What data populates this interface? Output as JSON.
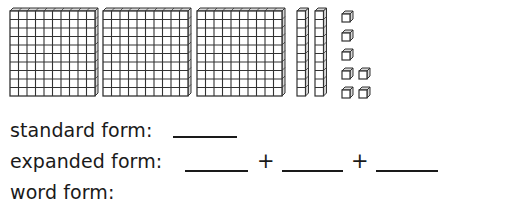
{
  "blocks": {
    "hundreds": 3,
    "tens": 2,
    "ones": 7,
    "colors": {
      "stroke": "#333333",
      "fill": "#ffffff",
      "side": "#d8d8d8"
    }
  },
  "prompts": {
    "standard_label": "standard form:",
    "expanded_label": "expanded form:",
    "word_label": "word form:",
    "plus_1": "+",
    "plus_2": "+"
  }
}
